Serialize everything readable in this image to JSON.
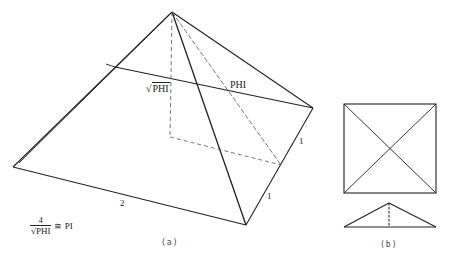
{
  "figure": {
    "panel_a": {
      "caption": "(a)",
      "labels": {
        "sqrt_phi": "PHI",
        "sqrt_symbol": "√",
        "phi": "PHI",
        "base_edge": "2",
        "half_edge_upper": "1",
        "half_edge_lower": "1"
      },
      "formula": {
        "numerator": "4",
        "sqrt_symbol": "√",
        "denominator": "PHI",
        "relation": "≅ PI"
      }
    },
    "panel_b": {
      "caption": "(b)"
    },
    "colors": {
      "line": "#222222",
      "dashed": "#555555",
      "background": "#ffffff"
    }
  }
}
